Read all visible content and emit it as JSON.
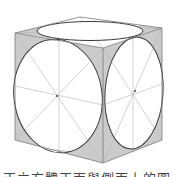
{
  "figure": {
    "colors": {
      "background": "#ffffff",
      "edge": "#7a7a7a",
      "guide": "#b5b5b5",
      "circle": "#3a3a3a",
      "shade": "#d0d0d0",
      "hatch": "#a8a8a8"
    },
    "vertices": {
      "top_left": [
        15,
        33
      ],
      "top_back": [
        80,
        17
      ],
      "top_right": [
        162,
        28
      ],
      "top_front": [
        103,
        48
      ],
      "bottom_left": [
        15,
        140
      ],
      "bottom_front": [
        103,
        163
      ],
      "bottom_right": [
        162,
        140
      ]
    },
    "faces": [
      {
        "name": "top",
        "circle": {
          "cx": 90,
          "cy": 31,
          "rx": 53,
          "ry": 9.5,
          "rotate": 0
        }
      },
      {
        "name": "left",
        "circle": {
          "cx": 58,
          "cy": 96,
          "rx": 44,
          "ry": 57,
          "rotate": -8
        }
      },
      {
        "name": "right",
        "circle": {
          "cx": 134,
          "cy": 93,
          "rx": 29,
          "ry": 56,
          "rotate": 4
        }
      }
    ]
  },
  "caption": {
    "text": "正立方體正面與側面上的圓",
    "note": "caption is cropped at bottom edge of image"
  }
}
